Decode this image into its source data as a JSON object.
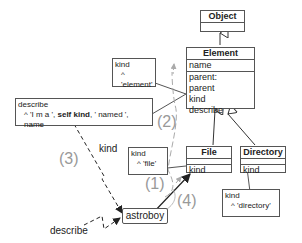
{
  "classes": {
    "object": {
      "name": "Object"
    },
    "element": {
      "name": "Element",
      "attributes": [
        "name"
      ],
      "methods": [
        "parent:",
        "parent",
        "kind",
        "describe"
      ]
    },
    "file": {
      "name": "File",
      "methods": [
        "kind"
      ]
    },
    "directory": {
      "name": "Directory",
      "methods": [
        "kind"
      ]
    }
  },
  "notes": {
    "element_kind": {
      "line1": "kind",
      "line2": "^ 'element'"
    },
    "describe": {
      "line1": "describe",
      "line2_pre": "^ 'I m a ', ",
      "line2_bold": "self kind",
      "line2_post": ", ' named ', name"
    },
    "file_kind": {
      "line1": "kind",
      "line2": "^ 'file'"
    },
    "directory_kind": {
      "line1": "kind",
      "line2": "^ 'directory'"
    }
  },
  "instance": {
    "name": "astroboy"
  },
  "messages": {
    "kind": "kind",
    "describe": "describe"
  },
  "steps": [
    "(1)",
    "(2)",
    "(3)",
    "(4)"
  ]
}
